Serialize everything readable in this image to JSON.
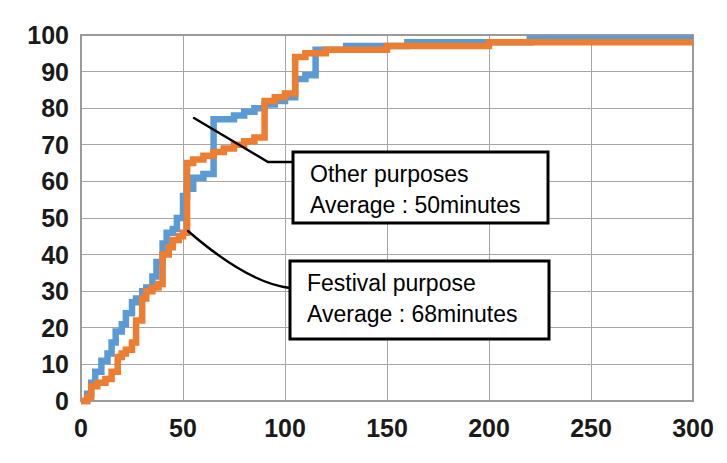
{
  "chart_data": {
    "type": "line",
    "title": "",
    "xlabel": "",
    "ylabel": "",
    "xlim": [
      0,
      300
    ],
    "ylim": [
      0,
      100
    ],
    "xticks": [
      0,
      50,
      100,
      150,
      200,
      250,
      300
    ],
    "yticks": [
      0,
      10,
      20,
      30,
      40,
      50,
      60,
      70,
      80,
      90,
      100
    ],
    "grid": true,
    "legend_position": "none",
    "step_style": "post",
    "series": [
      {
        "name": "Other purposes",
        "color": "#5B9BD5",
        "x": [
          0,
          3,
          5,
          7,
          10,
          13,
          15,
          17,
          20,
          22,
          25,
          27,
          30,
          32,
          35,
          37,
          40,
          42,
          45,
          47,
          50,
          52,
          55,
          60,
          65,
          70,
          75,
          80,
          85,
          90,
          95,
          100,
          105,
          110,
          115,
          120,
          130,
          140,
          150,
          160,
          180,
          200,
          220,
          250,
          280,
          300
        ],
        "y": [
          0,
          2,
          5,
          8,
          11,
          13,
          16,
          19,
          21,
          24,
          27,
          28,
          30,
          31,
          34,
          38,
          43,
          46,
          47,
          50,
          56,
          58,
          61,
          62,
          77,
          77,
          78,
          79,
          80,
          81,
          82,
          83,
          88,
          89,
          96,
          96,
          97,
          97,
          97,
          98,
          98,
          98,
          99,
          99,
          99,
          99
        ]
      },
      {
        "name": "Festival purpose",
        "color": "#ED7D31",
        "x": [
          0,
          3,
          5,
          8,
          12,
          15,
          18,
          20,
          22,
          25,
          27,
          30,
          32,
          35,
          38,
          40,
          43,
          45,
          48,
          50,
          52,
          55,
          60,
          65,
          70,
          75,
          80,
          85,
          90,
          95,
          100,
          105,
          110,
          115,
          120,
          130,
          140,
          150,
          170,
          200,
          230,
          260,
          300
        ],
        "y": [
          0,
          1,
          4,
          5,
          6,
          8,
          12,
          13,
          14,
          16,
          22,
          28,
          30,
          31,
          32,
          40,
          42,
          44,
          45,
          46,
          65,
          66,
          67,
          68,
          69,
          70,
          71,
          72,
          82,
          83,
          84,
          94,
          95,
          95,
          96,
          96,
          96,
          97,
          97,
          98,
          98,
          98,
          98
        ]
      }
    ],
    "annotations": [
      {
        "id": "other-purposes-callout",
        "line1": "Other purposes",
        "line2": "Average : 50minutes",
        "box": {
          "x": 293,
          "y": 152,
          "width": 255,
          "height": 71
        },
        "leader": {
          "from_x": 194,
          "from_y": 118,
          "mid_x": 268,
          "mid_y": 162,
          "to_x": 293,
          "to_y": 162,
          "curved": false
        }
      },
      {
        "id": "festival-purpose-callout",
        "line1": "Festival purpose",
        "line2": "Average : 68minutes",
        "box": {
          "x": 290,
          "y": 261,
          "width": 259,
          "height": 78
        },
        "leader": {
          "from_x": 188,
          "from_y": 231,
          "mid_x": 248,
          "mid_y": 283,
          "to_x": 290,
          "to_y": 288,
          "curved": true
        }
      }
    ],
    "plot_area": {
      "left": 81,
      "top": 35,
      "right": 693,
      "bottom": 401
    }
  }
}
